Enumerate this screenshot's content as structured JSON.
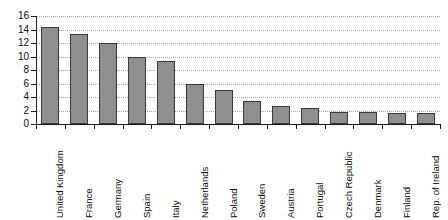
{
  "chart_data": {
    "type": "bar",
    "title": "",
    "subtitle": "",
    "xlabel": "",
    "ylabel": "",
    "ylim": [
      0,
      16
    ],
    "ytick_step": 2,
    "yticks": [
      16,
      14,
      12,
      10,
      8,
      6,
      4,
      2,
      0
    ],
    "grid": true,
    "grid_style": "dotted horizontal",
    "legend": null,
    "legend_position": "none",
    "xtick_label_rotation": -90,
    "categories": [
      "United Kingdom",
      "France",
      "Germany",
      "Spain",
      "Italy",
      "Netherlands",
      "Poland",
      "Sweden",
      "Austria",
      "Portugal",
      "Czech Republic",
      "Denmark",
      "Finland",
      "Rep. of Ireland"
    ],
    "values": [
      14.3,
      13.3,
      12.0,
      10.0,
      9.4,
      5.9,
      5.1,
      3.4,
      2.6,
      2.4,
      1.8,
      1.75,
      1.6,
      1.7
    ],
    "series": [
      {
        "name": "",
        "values": [
          14.3,
          13.3,
          12.0,
          10.0,
          9.4,
          5.9,
          5.1,
          3.4,
          2.6,
          2.4,
          1.8,
          1.75,
          1.6,
          1.7
        ]
      }
    ]
  },
  "style": {
    "bar_fill": "#8f8f8f",
    "bar_edge": "#3a3a3a",
    "axis_color": "#1a1a1a",
    "grid_color": "#a8a8a8",
    "background": "#ffffff"
  }
}
